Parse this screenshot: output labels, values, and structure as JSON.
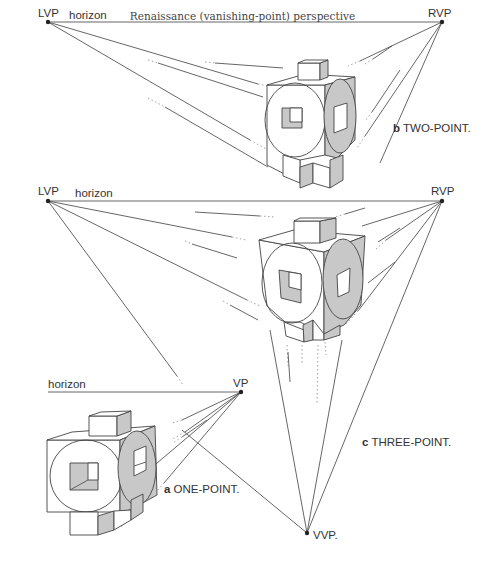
{
  "title": "Renaissance (vanishing-point) perspective",
  "panels": {
    "two_point": {
      "letter": "b",
      "label": "TWO-POINT.",
      "left_vp": "LVP",
      "right_vp": "RVP",
      "horizon": "horizon"
    },
    "three_point": {
      "letter": "c",
      "label": "THREE-POINT.",
      "left_vp": "LVP",
      "right_vp": "RVP",
      "vertical_vp": "VVP.",
      "horizon": "horizon"
    },
    "one_point": {
      "letter": "a",
      "label": "ONE-POINT.",
      "vp": "VP",
      "horizon": "horizon"
    }
  },
  "colors": {
    "line": "#555555",
    "shade": "#c8c8c8",
    "text": "#333333"
  }
}
